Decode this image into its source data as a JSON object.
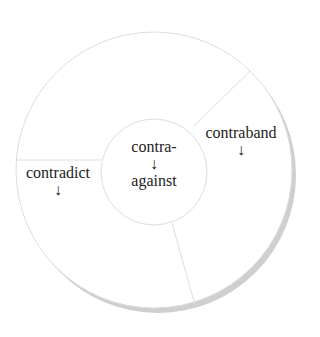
{
  "diagram": {
    "center": {
      "prefix": "contra-",
      "arrow": "↓",
      "meaning": "against"
    },
    "segments": [
      {
        "word": "contraband",
        "arrow": "↓"
      },
      {
        "word": "contradict",
        "arrow": "↓"
      }
    ],
    "colors": {
      "stroke": "#dcdcdc",
      "shadow": "#d0d0d0",
      "text": "#222222"
    }
  }
}
